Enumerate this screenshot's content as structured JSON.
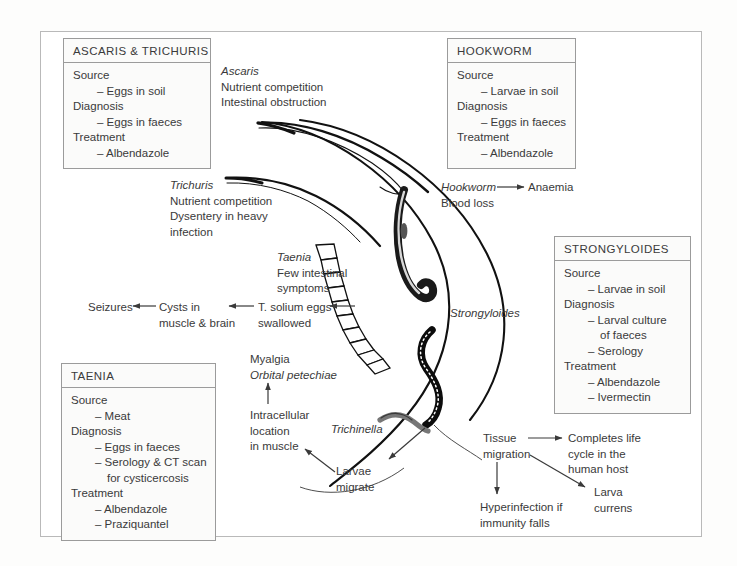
{
  "boxes": {
    "ascaris_trichuris": {
      "title": "ASCARIS & TRICHURIS",
      "lines": [
        {
          "text": "Source",
          "indent": 0
        },
        {
          "text": "– Eggs in soil",
          "indent": 1
        },
        {
          "text": "Diagnosis",
          "indent": 0
        },
        {
          "text": "– Eggs in faeces",
          "indent": 1
        },
        {
          "text": "Treatment",
          "indent": 0
        },
        {
          "text": "– Albendazole",
          "indent": 1
        }
      ]
    },
    "hookworm": {
      "title": "HOOKWORM",
      "lines": [
        {
          "text": "Source",
          "indent": 0
        },
        {
          "text": "– Larvae in soil",
          "indent": 1
        },
        {
          "text": "Diagnosis",
          "indent": 0
        },
        {
          "text": "– Eggs in faeces",
          "indent": 1
        },
        {
          "text": "Treatment",
          "indent": 0
        },
        {
          "text": "– Albendazole",
          "indent": 1
        }
      ]
    },
    "strongyloides": {
      "title": "STRONGYLOIDES",
      "lines": [
        {
          "text": "Source",
          "indent": 0
        },
        {
          "text": "– Larvae in soil",
          "indent": 1
        },
        {
          "text": "Diagnosis",
          "indent": 0
        },
        {
          "text": "– Larval culture",
          "indent": 1
        },
        {
          "text": "of faeces",
          "indent": 2
        },
        {
          "text": "– Serology",
          "indent": 1
        },
        {
          "text": "Treatment",
          "indent": 0
        },
        {
          "text": "– Albendazole",
          "indent": 1
        },
        {
          "text": "– Ivermectin",
          "indent": 1
        }
      ]
    },
    "taenia": {
      "title": "TAENIA",
      "lines": [
        {
          "text": "Source",
          "indent": 0
        },
        {
          "text": "– Meat",
          "indent": 1
        },
        {
          "text": "Diagnosis",
          "indent": 0
        },
        {
          "text": "– Eggs in faeces",
          "indent": 1
        },
        {
          "text": "– Serology & CT scan",
          "indent": 1
        },
        {
          "text": "for cysticercosis",
          "indent": 2
        },
        {
          "text": "Treatment",
          "indent": 0
        },
        {
          "text": "– Albendazole",
          "indent": 1
        },
        {
          "text": "– Praziquantel",
          "indent": 1
        }
      ]
    }
  },
  "annotations": {
    "ascaris": {
      "name": "Ascaris",
      "line1": "Nutrient competition",
      "line2": "Intestinal obstruction"
    },
    "trichuris": {
      "name": "Trichuris",
      "line1": "Nutrient competition",
      "line2": "Dysentery in heavy",
      "line3": "infection"
    },
    "hookworm": {
      "name": "Hookworm",
      "line1": "Blood loss",
      "result": "Anaemia"
    },
    "taenia": {
      "name": "Taenia",
      "line1": "Few intestinal",
      "line2": "symptoms"
    },
    "strongyloides": {
      "name": "Strongyloides"
    },
    "cysticercosis_chain": {
      "seizures": "Seizures",
      "cysts_line1": "Cysts in",
      "cysts_line2": "muscle & brain",
      "eggs_line1": "T. solium eggs",
      "eggs_line2": "swallowed"
    },
    "trichinella": {
      "name": "Trichinella",
      "larvae_line1": "Larvae",
      "larvae_line2": "migrate",
      "intracell_line1": "Intracellular",
      "intracell_line2": "location",
      "intracell_line3": "in muscle",
      "myalgia": "Myalgia",
      "petechiae": "Orbital petechiae"
    },
    "strongyloides_chain": {
      "tissue_line1": "Tissue",
      "tissue_line2": "migration",
      "completes_line1": "Completes life",
      "completes_line2": "cycle in the",
      "completes_line3": "human host",
      "hyper_line1": "Hyperinfection if",
      "hyper_line2": "immunity falls",
      "larva_line1": "Larva",
      "larva_line2": "currens"
    }
  },
  "colors": {
    "ink": "#3a3a3a",
    "outline": "#111111",
    "box_border": "#9b9b9b",
    "box_fill": "#fbfbfa",
    "page_border": "#b9b9b9",
    "worm_gray": "#6e6e6e"
  }
}
